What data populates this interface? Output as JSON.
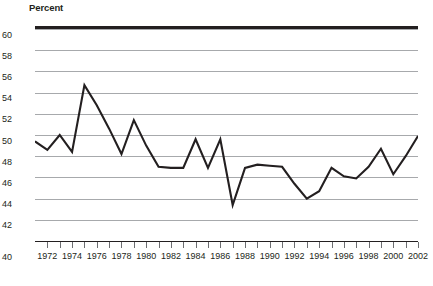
{
  "chart": {
    "axis_title": "Percent",
    "y_axis": {
      "labels": [
        "60",
        "58",
        "56",
        "54",
        "52",
        "50",
        "48",
        "46",
        "44",
        "42",
        "40"
      ],
      "min": 40,
      "max": 60,
      "step": 2
    },
    "x_axis": {
      "labels": [
        "1972",
        "1974",
        "1976",
        "1978",
        "1980",
        "1982",
        "1984",
        "1986",
        "1988",
        "1990",
        "1992",
        "1994",
        "1996",
        "1998",
        "2000",
        "2002"
      ],
      "min": 1971,
      "max": 2002
    },
    "colors": {
      "line": "#231f20",
      "grid": "#a7a9ac",
      "rule": "#231f20",
      "text": "#231f20"
    }
  },
  "chart_data": {
    "type": "line",
    "title": "",
    "subtitle": "",
    "xlabel": "",
    "ylabel": "Percent",
    "xlim": [
      1971,
      2002
    ],
    "ylim": [
      40,
      60
    ],
    "grid": true,
    "legend": false,
    "x": [
      1971,
      1972,
      1973,
      1974,
      1975,
      1976,
      1977,
      1978,
      1979,
      1980,
      1981,
      1982,
      1983,
      1984,
      1985,
      1986,
      1987,
      1988,
      1989,
      1990,
      1991,
      1992,
      1993,
      1994,
      1995,
      1996,
      1997,
      1998,
      1999,
      2000,
      2001,
      2002
    ],
    "series": [
      {
        "name": "Percent",
        "values": [
          49.4,
          48.6,
          50.0,
          48.4,
          54.7,
          52.8,
          50.6,
          48.2,
          51.4,
          49.0,
          47.0,
          46.9,
          46.9,
          49.6,
          46.9,
          49.6,
          43.4,
          46.9,
          47.2,
          47.1,
          47.0,
          45.4,
          44.0,
          44.7,
          46.9,
          46.1,
          45.9,
          47.0,
          48.7,
          46.3,
          48.0,
          49.9
        ]
      }
    ]
  }
}
